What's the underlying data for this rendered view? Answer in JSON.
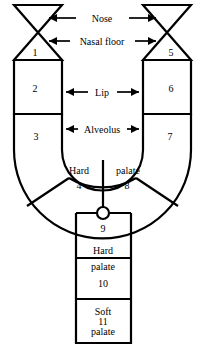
{
  "diagram": {
    "type": "anatomical-schematic",
    "stroke_color": "#000000",
    "fill_color": "#ffffff",
    "background": "#ffffff",
    "width": 205,
    "height": 347
  },
  "annotations": [
    {
      "id": "nose",
      "label": "Nose",
      "arrows": "both",
      "x": 102,
      "y": 18
    },
    {
      "id": "nasal-floor",
      "label": "Nasal floor",
      "arrows": "both",
      "x": 102,
      "y": 41
    },
    {
      "id": "lip",
      "label": "Lip",
      "arrows": "both",
      "x": 102,
      "y": 92
    },
    {
      "id": "alveolus",
      "label": "Alveolus",
      "arrows": "both",
      "x": 102,
      "y": 129
    }
  ],
  "regions": [
    {
      "number": "1",
      "x": 35,
      "y": 52,
      "name": "left-nasal-floor-triangle"
    },
    {
      "number": "2",
      "x": 35,
      "y": 88,
      "name": "left-lip-block"
    },
    {
      "number": "3",
      "x": 36,
      "y": 136,
      "name": "left-alveolus-outer"
    },
    {
      "number": "4",
      "x": 79,
      "y": 185,
      "name": "left-hard-palate-segment"
    },
    {
      "number": "5",
      "x": 171,
      "y": 52,
      "name": "right-nasal-floor-triangle"
    },
    {
      "number": "6",
      "x": 171,
      "y": 88,
      "name": "right-lip-block"
    },
    {
      "number": "7",
      "x": 170,
      "y": 136,
      "name": "right-alveolus-outer"
    },
    {
      "number": "8",
      "x": 127,
      "y": 185,
      "name": "right-hard-palate-segment"
    },
    {
      "number": "9",
      "x": 103,
      "y": 228,
      "name": "vomer-segment"
    },
    {
      "number": "10",
      "x": 103,
      "y": 283,
      "name": "hard-palate-segment"
    },
    {
      "number": "11",
      "x": 103,
      "y": 321,
      "name": "soft-palate-segment"
    }
  ],
  "inline_text": [
    {
      "id": "hard-left",
      "label": "Hard",
      "x": 79,
      "y": 170
    },
    {
      "id": "palate-right",
      "label": "palate",
      "x": 128,
      "y": 170
    },
    {
      "id": "hard-col",
      "label": "Hard",
      "x": 103,
      "y": 250
    },
    {
      "id": "palate-col",
      "label": "palate",
      "x": 103,
      "y": 266
    },
    {
      "id": "soft-col",
      "label": "Soft",
      "x": 103,
      "y": 311
    },
    {
      "id": "palate-soft",
      "label": "palate",
      "x": 103,
      "y": 331
    }
  ]
}
